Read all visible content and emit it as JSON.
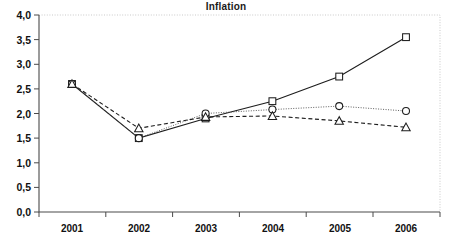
{
  "chart_data": {
    "type": "line",
    "title": "Inflation",
    "xlabel": "",
    "ylabel": "",
    "categories": [
      "2001",
      "2002",
      "2003",
      "2004",
      "2005",
      "2006"
    ],
    "ylim": [
      0.0,
      4.0
    ],
    "ytick_labels": [
      "0,0",
      "0,5",
      "1,0",
      "1,5",
      "2,0",
      "2,5",
      "3,0",
      "3,5",
      "4,0"
    ],
    "ytick_values": [
      0.0,
      0.5,
      1.0,
      1.5,
      2.0,
      2.5,
      3.0,
      3.5,
      4.0
    ],
    "grid": false,
    "legend": "none",
    "decimal_separator": ",",
    "series": [
      {
        "name": "series-square",
        "marker": "square",
        "line_style": "solid",
        "values": [
          2.6,
          1.5,
          1.9,
          2.25,
          2.75,
          3.55
        ]
      },
      {
        "name": "series-circle",
        "marker": "circle",
        "line_style": "dotted",
        "values": [
          2.6,
          1.5,
          2.0,
          2.08,
          2.15,
          2.05
        ]
      },
      {
        "name": "series-triangle",
        "marker": "triangle",
        "line_style": "dashed",
        "values": [
          2.6,
          1.7,
          1.93,
          1.95,
          1.85,
          1.72
        ]
      }
    ]
  },
  "yticks": {
    "t0": "0,0",
    "t1": "0,5",
    "t2": "1,0",
    "t3": "1,5",
    "t4": "2,0",
    "t5": "2,5",
    "t6": "3,0",
    "t7": "3,5",
    "t8": "4,0"
  },
  "xticks": {
    "t0": "2001",
    "t1": "2002",
    "t2": "2003",
    "t3": "2004",
    "t4": "2005",
    "t5": "2006"
  },
  "colors": {
    "line": "#1d1d1d",
    "axis": "#4a4a4a",
    "frame": "#c9c9c9",
    "background": "#ffffff"
  }
}
